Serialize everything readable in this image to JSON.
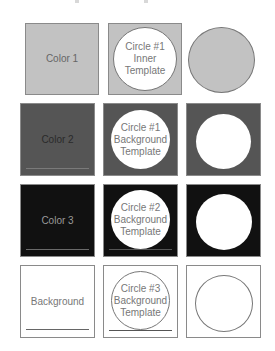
{
  "colors": {
    "color1": "#c2c2c2",
    "color2": "#555555",
    "color3": "#111111",
    "background": "#ffffff",
    "circle_fill": "#ffffff",
    "outline": "#777777"
  },
  "rows": [
    {
      "swatch": {
        "label": "Color 1"
      },
      "template": {
        "lines": [
          "Circle #1",
          "Inner Template"
        ]
      },
      "result": {}
    },
    {
      "swatch": {
        "label": "Color 2"
      },
      "template": {
        "lines": [
          "Circle #1",
          "Background",
          "Template"
        ]
      },
      "result": {}
    },
    {
      "swatch": {
        "label": "Color 3"
      },
      "template": {
        "lines": [
          "Circle #2",
          "Background",
          "Template"
        ]
      },
      "result": {}
    },
    {
      "swatch": {
        "label": "Background"
      },
      "template": {
        "lines": [
          "Circle #3",
          "Background",
          "Template"
        ]
      },
      "result": {}
    }
  ]
}
